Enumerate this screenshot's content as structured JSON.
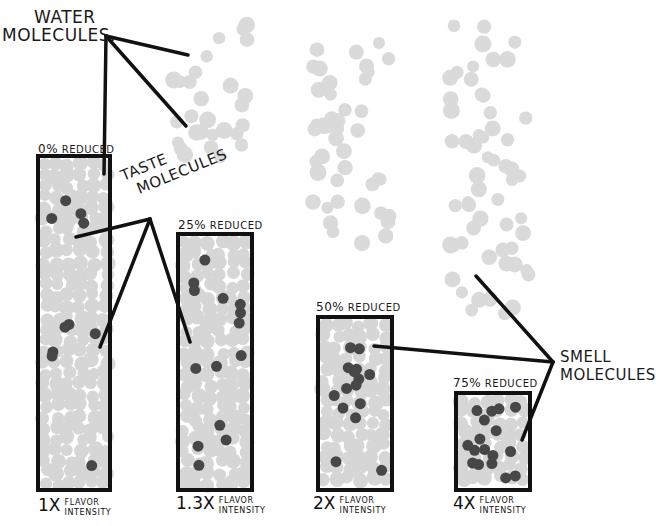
{
  "diagram": {
    "annotations": {
      "water": {
        "line1": "WATER",
        "line2": "MOLECULES."
      },
      "taste": {
        "line1": "TASTE",
        "line2": "MOLECULES"
      },
      "smell": {
        "line1": "SMELL",
        "line2": "MOLECULES"
      }
    },
    "bars": [
      {
        "id": "bar-0",
        "reduced_pct": "0%",
        "reduced_word": "REDUCED",
        "multiplier": "1X",
        "flavor_line1": "FLAVOR",
        "flavor_line2": "INTENSITY",
        "x": 38,
        "y": 156,
        "w": 72,
        "h": 334
      },
      {
        "id": "bar-25",
        "reduced_pct": "25%",
        "reduced_word": "REDUCED",
        "multiplier": "1.3X",
        "flavor_line1": "FLAVOR",
        "flavor_line2": "INTENSITY",
        "x": 178,
        "y": 234,
        "w": 74,
        "h": 256
      },
      {
        "id": "bar-50",
        "reduced_pct": "50%",
        "reduced_word": "REDUCED",
        "multiplier": "2X",
        "flavor_line1": "FLAVOR",
        "flavor_line2": "INTENSITY",
        "x": 318,
        "y": 317,
        "w": 74,
        "h": 173
      },
      {
        "id": "bar-75",
        "reduced_pct": "75%",
        "reduced_word": "REDUCED",
        "multiplier": "4X",
        "flavor_line1": "FLAVOR",
        "flavor_line2": "INTENSITY",
        "x": 456,
        "y": 393,
        "w": 74,
        "h": 97
      }
    ],
    "colors": {
      "outline": "#111111",
      "water_molecule": "#d4d4d4",
      "taste_molecule": "#4a4a4a",
      "background": "#ffffff"
    }
  }
}
